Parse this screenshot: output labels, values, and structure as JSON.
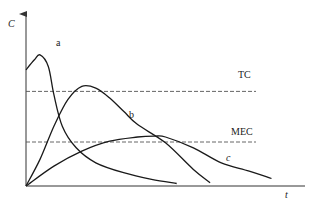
{
  "chart_data": {
    "type": "line",
    "title": "",
    "xlabel": "t",
    "ylabel": "C",
    "xlim": [
      0,
      10
    ],
    "ylim": [
      0,
      10
    ],
    "grid": false,
    "series": [
      {
        "name": "a",
        "x": [
          0,
          0.3,
          0.5,
          0.8,
          1.0,
          1.3,
          1.8,
          2.5,
          3.5,
          4.5,
          5.4
        ],
        "y": [
          7.0,
          7.6,
          7.9,
          7.2,
          5.5,
          3.6,
          2.3,
          1.4,
          0.8,
          0.4,
          0.15
        ]
      },
      {
        "name": "b",
        "x": [
          0,
          0.5,
          1.0,
          1.5,
          2.0,
          2.5,
          3.0,
          3.5,
          4.0,
          5.0,
          6.0,
          6.6
        ],
        "y": [
          0,
          1.6,
          3.6,
          5.2,
          6.0,
          5.9,
          5.3,
          4.5,
          3.7,
          2.6,
          1.0,
          0.2
        ]
      },
      {
        "name": "c",
        "x": [
          0,
          1.0,
          2.0,
          3.0,
          4.0,
          4.6,
          5.0,
          6.0,
          7.0,
          8.0,
          8.8
        ],
        "y": [
          0,
          1.2,
          2.1,
          2.7,
          2.95,
          3.0,
          2.95,
          2.3,
          1.4,
          0.9,
          0.45
        ]
      }
    ],
    "reference_lines": [
      {
        "name": "TC",
        "y": 5.7
      },
      {
        "name": "MEC",
        "y": 2.65
      }
    ],
    "annotations": [
      "a",
      "b",
      "c",
      "TC",
      "MEC"
    ]
  },
  "labels": {
    "y_axis": "C",
    "x_axis": "t",
    "curve_a": "a",
    "curve_b": "b",
    "curve_c": "c",
    "tc": "TC",
    "mec": "MEC"
  }
}
